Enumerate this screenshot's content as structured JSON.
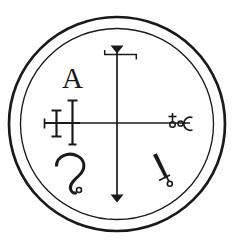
{
  "artwork": {
    "title": "Goetic Demon Seal Sigil",
    "kind": "occult-seal-line-drawing",
    "canvas": {
      "width": 235,
      "height": 248
    },
    "background_color": "#ffffff",
    "ink_color": "#1a1a1a"
  },
  "frame": {
    "outer_circle": {
      "name": "outer-ring",
      "center_x": 117,
      "center_y": 124,
      "radius": 108,
      "stroke_width": 2.6
    },
    "inner_circle": {
      "name": "inner-ring",
      "center_x": 117,
      "center_y": 124,
      "radius": 96,
      "stroke_width": 1.4
    }
  },
  "cross": {
    "center_x": 117,
    "center_y": 123,
    "vertical": {
      "top_y": 45,
      "bottom_y": 202,
      "stroke_width": 1.6
    },
    "horizontal": {
      "left_x": 44,
      "right_x": 190,
      "stroke_width": 1.5
    }
  },
  "glyphs": [
    {
      "id": "letter-a",
      "label": "A",
      "description": "serif capital letter A, upper-left quadrant",
      "x": 62,
      "y": 87
    },
    {
      "id": "top-arrowhead-crossbar",
      "label": "arrowhead with hooked crossbar",
      "description": "downward solid triangle atop the vertical axis with a horizontal bar hooked at both ends"
    },
    {
      "id": "bottom-arrowhead",
      "label": "arrowhead",
      "description": "downward solid triangle terminating the vertical axis"
    },
    {
      "id": "double-barred-left",
      "label": "double-barred terminal",
      "description": "two serif-capped vertical bars crossing the left horizontal arm, plus an end tick"
    },
    {
      "id": "right-terminal-cluster",
      "label": "cross-circle, dot and crescent",
      "description": "small cross-topped circle, a small ring, and a C-shaped crescent at the right horizontal arm"
    },
    {
      "id": "s-curve-hook",
      "label": "S-curve with terminal ring",
      "description": "question-mark-like S curve ending in a small circle, lower-left quadrant"
    },
    {
      "id": "dagger-stroke",
      "label": "dagger with cross-guard and ring",
      "description": "thick diagonal stroke ending in a small cross and tiny circle, lower-right quadrant"
    }
  ]
}
